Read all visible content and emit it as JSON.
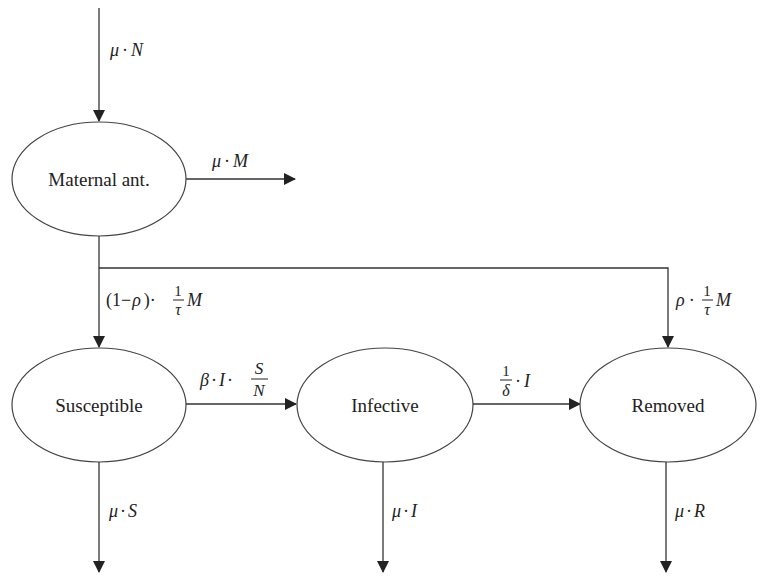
{
  "diagram": {
    "type": "compartmental-flow-diagram",
    "nodes": {
      "maternal": {
        "label": "Maternal ant."
      },
      "susceptible": {
        "label": "Susceptible"
      },
      "infective": {
        "label": "Infective"
      },
      "removed": {
        "label": "Removed"
      }
    },
    "edges": {
      "birth": {
        "from": "outside",
        "to": "maternal",
        "mu": "μ",
        "dot": "·",
        "var": "N"
      },
      "maternal_death": {
        "from": "maternal",
        "to": "outside",
        "mu": "μ",
        "dot": "·",
        "var": "M"
      },
      "maternal_to_susceptible": {
        "from": "maternal",
        "to": "susceptible",
        "prefix": "(1−",
        "rho": "ρ",
        "suffix": ")·",
        "num": "1",
        "den": "τ",
        "var": "M"
      },
      "maternal_to_removed": {
        "from": "maternal",
        "to": "removed",
        "rho": "ρ",
        "dot": "·",
        "num": "1",
        "den": "τ",
        "var": "M"
      },
      "infection": {
        "from": "susceptible",
        "to": "infective",
        "beta": "β",
        "dot": "·",
        "I": "I",
        "dot2": "·",
        "num": "S",
        "den": "N"
      },
      "recovery": {
        "from": "infective",
        "to": "removed",
        "num": "1",
        "den": "δ",
        "dot": "·",
        "var": "I"
      },
      "susceptible_death": {
        "from": "susceptible",
        "to": "outside",
        "mu": "μ",
        "dot": "·",
        "var": "S"
      },
      "infective_death": {
        "from": "infective",
        "to": "outside",
        "mu": "μ",
        "dot": "·",
        "var": "I"
      },
      "removed_death": {
        "from": "removed",
        "to": "outside",
        "mu": "μ",
        "dot": "·",
        "var": "R"
      }
    }
  }
}
